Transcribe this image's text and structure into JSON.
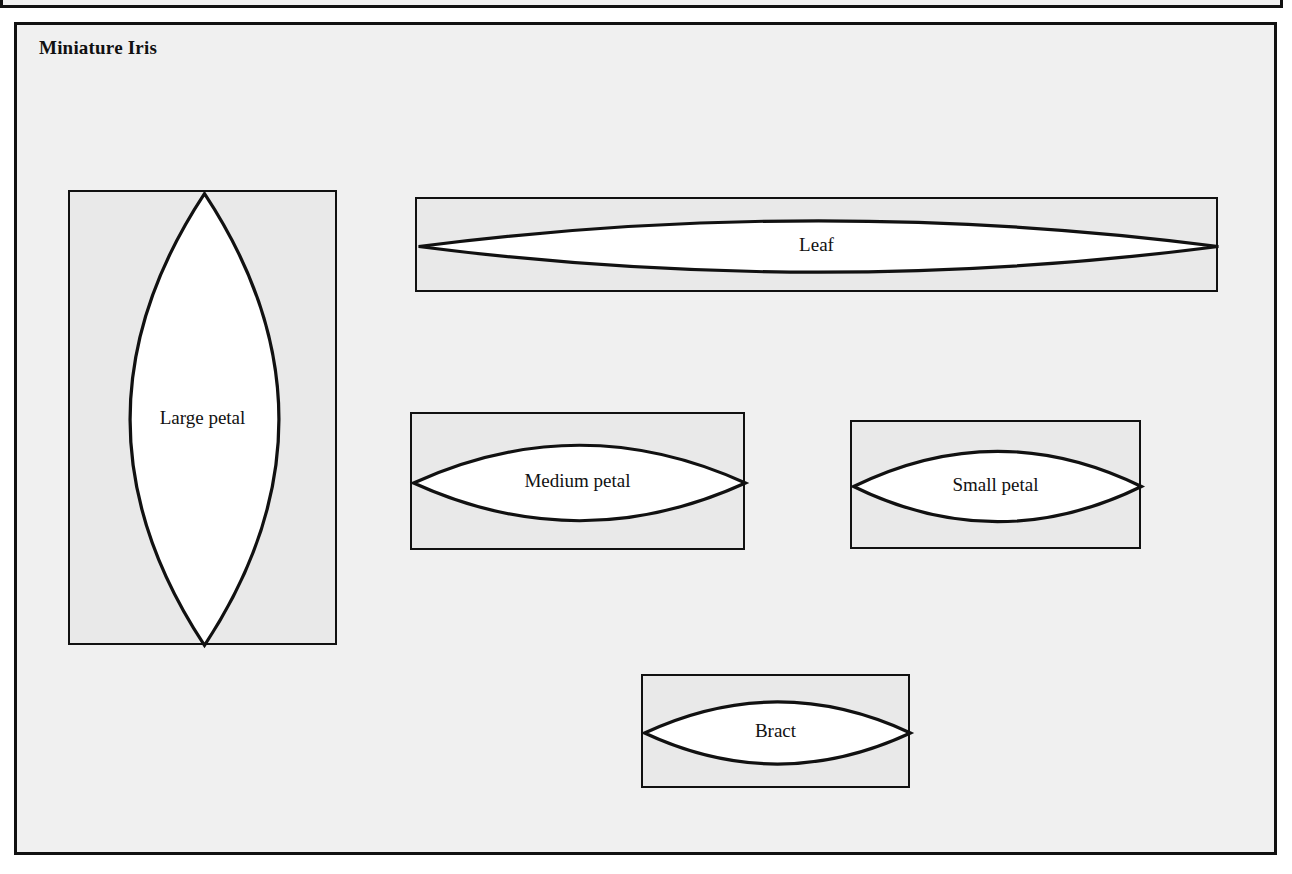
{
  "document": {
    "title": "Miniature Iris",
    "background_color": "#f0f0f0",
    "ink_color": "#111111",
    "piece_fill_color": "#e9e9e9",
    "lens_fill_color": "#ffffff"
  },
  "pieces": [
    {
      "id": "large-petal",
      "label": "Large petal",
      "orientation": "vertical",
      "rect": {
        "x": 68,
        "y": 190,
        "width": 269,
        "height": 455
      }
    },
    {
      "id": "leaf",
      "label": "Leaf",
      "orientation": "horizontal",
      "rect": {
        "x": 415,
        "y": 197,
        "width": 803,
        "height": 95
      }
    },
    {
      "id": "medium-petal",
      "label": "Medium petal",
      "orientation": "horizontal",
      "rect": {
        "x": 410,
        "y": 412,
        "width": 335,
        "height": 138
      }
    },
    {
      "id": "small-petal",
      "label": "Small petal",
      "orientation": "horizontal",
      "rect": {
        "x": 850,
        "y": 420,
        "width": 291,
        "height": 129
      }
    },
    {
      "id": "bract",
      "label": "Bract",
      "orientation": "horizontal",
      "rect": {
        "x": 641,
        "y": 674,
        "width": 269,
        "height": 114
      }
    }
  ],
  "frames": {
    "top_partial": {
      "x": 0,
      "y": -42,
      "width": 1283,
      "height": 50
    },
    "main_sheet": {
      "x": 14,
      "y": 22,
      "width": 1263,
      "height": 833
    }
  }
}
